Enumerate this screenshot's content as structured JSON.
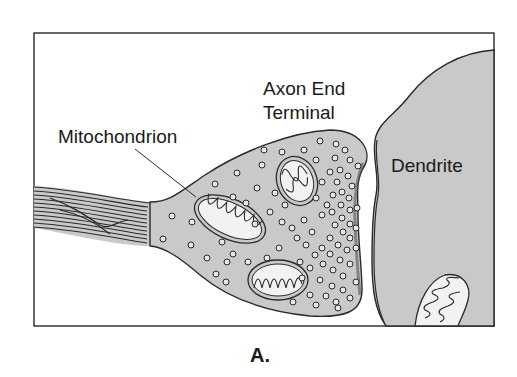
{
  "figure": {
    "panel_label": "A.",
    "labels": {
      "axon_terminal_line1": "Axon End",
      "axon_terminal_line2": "Terminal",
      "mitochondrion": "Mitochondrion",
      "dendrite": "Dendrite"
    },
    "colors": {
      "fill": "#c9c9c9",
      "stroke": "#2a2a2a",
      "background": "#ffffff",
      "vesicle_fill": "#e6e6e6"
    }
  }
}
